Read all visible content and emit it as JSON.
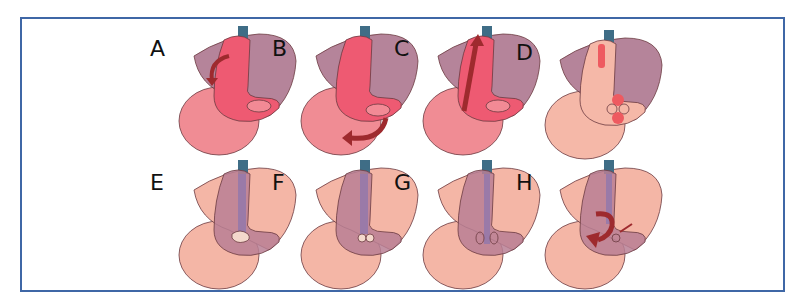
{
  "figure": {
    "frame_color": "#3f67a6",
    "panels": [
      {
        "label": "A",
        "stage": "full",
        "arrow": "left-curl",
        "stomach_color": "#ee5a72",
        "lower_color": "#f08c94",
        "liver_color": "#a86e88"
      },
      {
        "label": "B",
        "stage": "full",
        "arrow": "bottom-curl",
        "stomach_color": "#ee5a72",
        "lower_color": "#f08c94",
        "liver_color": "#a86e88"
      },
      {
        "label": "C",
        "stage": "full",
        "arrow": "up-straight",
        "stomach_color": "#ee5a72",
        "lower_color": "#f08c94",
        "liver_color": "#a86e88"
      },
      {
        "label": "D",
        "stage": "pale-with-nodules",
        "arrow": "none",
        "stomach_color": "#f5b8a8",
        "lower_color": "#f5b8a8",
        "liver_color": "#a86e88"
      },
      {
        "label": "E",
        "stage": "pale-liver",
        "arrow": "none",
        "stomach_color": "#b87f94",
        "lower_color": "#f4b6a6",
        "liver_color": "#f4b6a6"
      },
      {
        "label": "F",
        "stage": "pale-liver",
        "arrow": "none",
        "stomach_color": "#b87f94",
        "lower_color": "#f4b6a6",
        "liver_color": "#f4b6a6"
      },
      {
        "label": "G",
        "stage": "pale-liver",
        "arrow": "none",
        "stomach_color": "#b87f94",
        "lower_color": "#f4b6a6",
        "liver_color": "#f4b6a6"
      },
      {
        "label": "H",
        "stage": "pale-liver",
        "arrow": "twist",
        "stomach_color": "#b87f94",
        "lower_color": "#f4b6a6",
        "liver_color": "#f4b6a6"
      }
    ]
  }
}
